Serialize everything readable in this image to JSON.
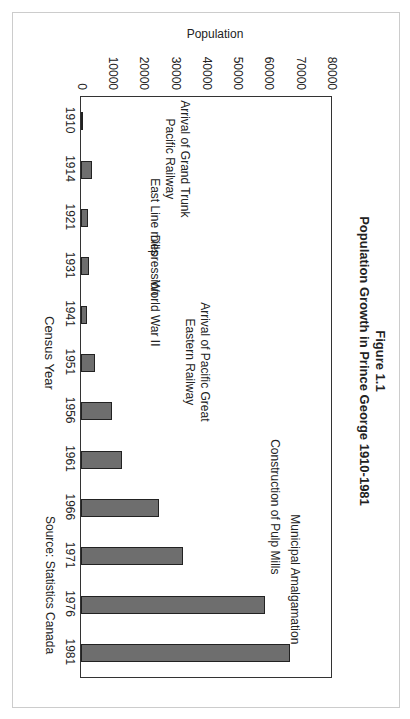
{
  "chart_data": {
    "type": "bar",
    "figure_label": "Figure 1.1",
    "title": "Population Growth in Prince George 1910-1981",
    "xlabel": "Census Year",
    "ylabel": "Population",
    "source": "Source: Statistics Canada",
    "ylim": [
      0,
      80000
    ],
    "yticks": [
      "0",
      "10000",
      "20000",
      "30000",
      "40000",
      "50000",
      "60000",
      "70000",
      "80000"
    ],
    "categories": [
      "1910",
      "1914",
      "1921",
      "1931",
      "1941",
      "1951",
      "1956",
      "1961",
      "1966",
      "1971",
      "1976",
      "1981"
    ],
    "values": [
      0,
      3500,
      2200,
      2500,
      2000,
      4500,
      10000,
      13000,
      25000,
      32500,
      59000,
      67000
    ],
    "annotations": [
      {
        "text": "Arrival of Grand Trunk Pacific Railway",
        "near": "1910-1914"
      },
      {
        "text": "East Line mills",
        "near": "1921"
      },
      {
        "text": "Depression",
        "near": "1931"
      },
      {
        "text": "World War II",
        "near": "1941"
      },
      {
        "text": "Arrival of Pacific Great Eastern Railway",
        "near": "1951"
      },
      {
        "text": "Construction of Pulp Mills",
        "near": "1966"
      },
      {
        "text": "Municipal Amalgamation",
        "near": "1971-1976"
      }
    ],
    "grid": false,
    "orientation": "page rotated 90 degrees"
  }
}
